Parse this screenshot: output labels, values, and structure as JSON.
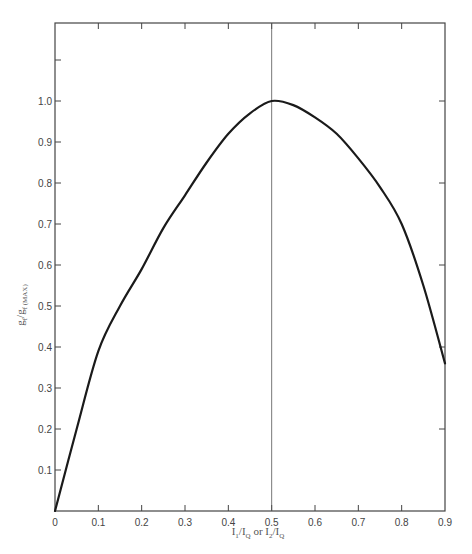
{
  "chart_data": {
    "type": "line",
    "title": "",
    "xlabel": "I1/IQ or I2/IQ",
    "ylabel": "gf/gf(MAX)",
    "xlim": [
      0,
      0.9
    ],
    "ylim": [
      0,
      1.2
    ],
    "grid": false,
    "legend": null,
    "x_ticks": [
      "0",
      "0.1",
      "0.2",
      "0.3",
      "0.4",
      "0.5",
      "0.6",
      "0.7",
      "0.8",
      "0.9"
    ],
    "y_ticks": [
      "0.1",
      "0.2",
      "0.3",
      "0.4",
      "0.5",
      "0.6",
      "0.7",
      "0.8",
      "0.9",
      "1.0"
    ],
    "annotations": [
      {
        "type": "vertical-line",
        "x": 0.5
      }
    ],
    "series": [
      {
        "name": "gf/gf(MAX)",
        "x": [
          0.0,
          0.05,
          0.1,
          0.15,
          0.2,
          0.25,
          0.3,
          0.35,
          0.4,
          0.45,
          0.5,
          0.55,
          0.6,
          0.65,
          0.7,
          0.75,
          0.8,
          0.85,
          0.9
        ],
        "values": [
          0.0,
          0.2,
          0.39,
          0.5,
          0.59,
          0.69,
          0.77,
          0.85,
          0.92,
          0.97,
          1.0,
          0.99,
          0.96,
          0.92,
          0.86,
          0.79,
          0.7,
          0.55,
          0.36
        ]
      }
    ]
  },
  "labels": {
    "origin": "0",
    "xlabel_main_1": "I",
    "xlabel_sub_1": "1",
    "xlabel_slash_1": "/I",
    "xlabel_sub_q1": "Q",
    "xlabel_or": " or ",
    "xlabel_main_2": "I",
    "xlabel_sub_2": "2",
    "xlabel_slash_2": "/I",
    "xlabel_sub_q2": "Q",
    "ylabel_main": "g",
    "ylabel_sub": "f",
    "ylabel_slash": "/g",
    "ylabel_sub2": "f (MAX)"
  }
}
